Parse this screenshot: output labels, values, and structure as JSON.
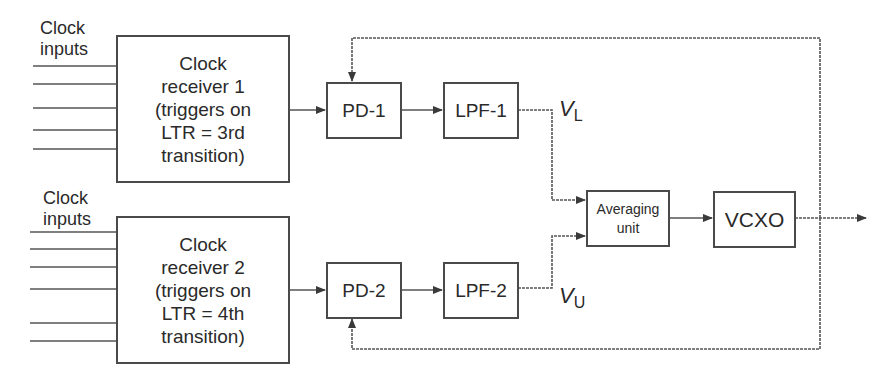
{
  "diagram": {
    "input_groups": [
      {
        "label_line1": "Clock",
        "label_line2": "inputs",
        "line_count": 5
      },
      {
        "label_line1": "Clock",
        "label_line2": "inputs",
        "line_count": 6
      }
    ],
    "receivers": [
      {
        "lines": [
          "Clock",
          "receiver 1",
          "(triggers on",
          "LTR = 3rd",
          "transition)"
        ]
      },
      {
        "lines": [
          "Clock",
          "receiver 2",
          "(triggers on",
          "LTR = 4th",
          "transition)"
        ]
      }
    ],
    "phase_detectors": [
      {
        "label": "PD-1"
      },
      {
        "label": "PD-2"
      }
    ],
    "filters": [
      {
        "label": "LPF-1"
      },
      {
        "label": "LPF-2"
      }
    ],
    "voltages": [
      {
        "symbol": "V",
        "subscript": "L"
      },
      {
        "symbol": "V",
        "subscript": "U"
      }
    ],
    "averaging_unit": {
      "line1": "Averaging",
      "line2": "unit"
    },
    "oscillator": {
      "label": "VCXO"
    },
    "colors": {
      "stroke": "#4a4a4a",
      "text": "#2a2a2a",
      "background": "#ffffff"
    }
  }
}
